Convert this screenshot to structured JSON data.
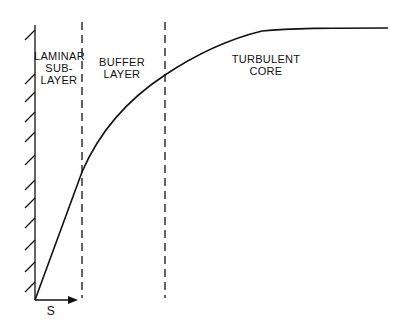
{
  "diagram": {
    "type": "velocity-profile",
    "regions": [
      {
        "id": "laminar",
        "label_line1": "LAMINAR",
        "label_line2": "SUB-",
        "label_line3": "LAYER"
      },
      {
        "id": "buffer",
        "label_line1": "BUFFER",
        "label_line2": "LAYER"
      },
      {
        "id": "turbulent",
        "label_line1": "TURBULENT",
        "label_line2": "CORE"
      }
    ],
    "axis_label": "S",
    "colors": {
      "ink": "#111111",
      "background": "#ffffff"
    }
  }
}
